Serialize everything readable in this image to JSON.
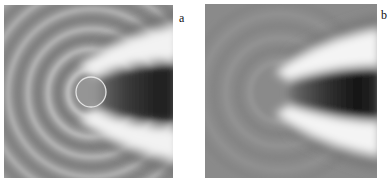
{
  "figure": {
    "panels": [
      {
        "label": "a",
        "description": "Wave field with scattering sphere; curved interference fringes on left, bright-dark-bright wake on right",
        "has_scatterer_outline": true
      },
      {
        "label": "b",
        "description": "Wave field without scatterer outline; uniform gray on left with faint fringes, bright-dark-bright wake on right",
        "has_scatterer_outline": false
      }
    ],
    "colors": {
      "background": "#ffffff",
      "mid_gray": "#8c8c8c",
      "bright_band": "#f4f4f4",
      "dark_core": "#1e1e1e",
      "circle_outline": "#e6e6e6"
    }
  }
}
